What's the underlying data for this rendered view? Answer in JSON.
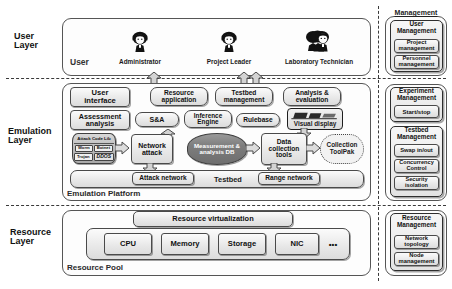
{
  "diagram": {
    "layers": [
      {
        "id": "user",
        "label": "User\nLayer"
      },
      {
        "id": "emulation",
        "label": "Emulation\nLayer"
      },
      {
        "id": "resource",
        "label": "Resource\nLayer"
      }
    ]
  },
  "user_layer": {
    "row_label": "User",
    "roles": [
      {
        "name": "Administrator",
        "icon": "person-icon"
      },
      {
        "name": "Project Leader",
        "icon": "person-icon"
      },
      {
        "name": "Laboratory Technician",
        "icon": "person-group-icon"
      }
    ]
  },
  "emulation_layer": {
    "platform_label": "Emulation Platform",
    "row1": {
      "title": "User\ninterface",
      "items": [
        "Resource\napplication",
        "Testbed\nmanagement",
        "Analysis &\nevaluation"
      ]
    },
    "row2": {
      "title": "Assessment\nanalysis",
      "items": [
        "S&A",
        "Inference\nEngine",
        "Rulebase"
      ],
      "visual_display": "Visual display",
      "visual_display_icon": "monitor-icon"
    },
    "row3": {
      "attack_code_lib": {
        "title": "Attack Code Lib",
        "items": [
          "Worm",
          "Botnet",
          "Trojan",
          "DDOS"
        ]
      },
      "network_attack": "Network\nattack",
      "measurement_db": "Measurement\n& analysis\nDB",
      "data_collection_tools": "Data\ncollection\ntools",
      "collection_toolpak": "Collection\nToolPak"
    },
    "row4": {
      "center_label": "Testbed",
      "left": "Attack network",
      "right": "Range network"
    }
  },
  "resource_layer": {
    "pool_label": "Resource Pool",
    "virtualization": "Resource virtualization",
    "resources": [
      "CPU",
      "Memory",
      "Storage",
      "NIC",
      "•••"
    ]
  },
  "management_panel": {
    "header": "Management",
    "groups": [
      {
        "id": "user-management",
        "title": "User\nManagement",
        "items": [
          "Project\nmanagement",
          "Personnel\nmanagement"
        ]
      },
      {
        "id": "experiment-management",
        "title": "Experiment\nManagement",
        "items": [
          "Start/stop"
        ]
      },
      {
        "id": "testbed-management",
        "title": "Testbed\nManagement",
        "items": [
          "Swap in/out",
          "Concurrency\nControl",
          "Security\nisolation"
        ]
      },
      {
        "id": "resource-management",
        "title": "Resource\nManagement",
        "items": [
          "Network\ntopology",
          "Node\nmanagement"
        ]
      }
    ]
  },
  "colors": {
    "outline": "#4a4a4a",
    "box_fill": "#e9e9e9",
    "db_fill": "#7d7d7d",
    "background": "#ffffff"
  }
}
